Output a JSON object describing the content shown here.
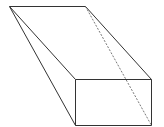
{
  "diagram": {
    "title": "",
    "shape": "oblique prism / wedge solid",
    "stroke_color": "#333333",
    "background": "#ffffff",
    "vertices": {
      "A": [
        9,
        6
      ],
      "B": [
        85,
        6
      ],
      "C": [
        75,
        79
      ],
      "D": [
        151,
        79
      ],
      "E": [
        75,
        125
      ],
      "F": [
        151,
        125
      ]
    },
    "edges": [
      {
        "from": "A",
        "to": "B",
        "style": "solid"
      },
      {
        "from": "A",
        "to": "C",
        "style": "solid"
      },
      {
        "from": "A",
        "to": "E",
        "style": "solid"
      },
      {
        "from": "B",
        "to": "D",
        "style": "solid"
      },
      {
        "from": "B",
        "to": "F",
        "style": "dashed"
      },
      {
        "from": "C",
        "to": "D",
        "style": "solid"
      },
      {
        "from": "C",
        "to": "E",
        "style": "solid"
      },
      {
        "from": "D",
        "to": "F",
        "style": "solid"
      },
      {
        "from": "E",
        "to": "F",
        "style": "solid"
      }
    ]
  }
}
